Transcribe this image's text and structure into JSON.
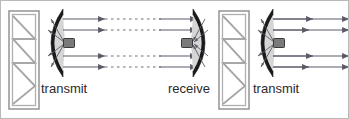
{
  "figure": {
    "width": 349,
    "height": 119,
    "background": "#ffffff",
    "border_color": "#b9b9b9"
  },
  "colors": {
    "tower_outline": "#9a9a9a",
    "tower_inner": "#bdbdbd",
    "dish_rim": "#1a1a1a",
    "dish_fill": "#d5d5d5",
    "beam_line": "#5b5b68",
    "feed_horn_fill": "#7a7a7a",
    "feed_horn_stroke": "#3a3a3a",
    "label_text": "#2b2b2b",
    "dashed_ray": "#6b6b78"
  },
  "labels": [
    {
      "id": "label-transmit-left",
      "text": "transmit",
      "x": 40,
      "y": 92
    },
    {
      "id": "label-receive",
      "text": "receive",
      "x": 167,
      "y": 92
    },
    {
      "id": "label-transmit-right",
      "text": "transmit",
      "x": 252,
      "y": 92
    }
  ],
  "towers": [
    {
      "id": "tower-left",
      "x": 8,
      "y": 10,
      "width": 30,
      "height": 98
    },
    {
      "id": "tower-right",
      "x": 218,
      "y": 10,
      "width": 30,
      "height": 98
    }
  ],
  "dishes": [
    {
      "id": "dish-transmit-left",
      "role": "transmit",
      "facing": "right",
      "apex_x": 42,
      "center_y": 42,
      "rim_x": 62,
      "half_height": 34,
      "feed_x": 64,
      "feed_y": 42
    },
    {
      "id": "dish-receive",
      "role": "receive",
      "facing": "left",
      "apex_x": 212,
      "center_y": 42,
      "rim_x": 192,
      "half_height": 34,
      "feed_x": 188,
      "feed_y": 42
    },
    {
      "id": "dish-transmit-right",
      "role": "transmit",
      "facing": "right",
      "apex_x": 252,
      "center_y": 42,
      "rim_x": 272,
      "half_height": 34,
      "feed_x": 274,
      "feed_y": 42
    }
  ],
  "beams": {
    "ray_y_positions": [
      18,
      29,
      55,
      66
    ],
    "segments": [
      {
        "id": "beam-left-to-receive",
        "from_x": 66,
        "to_x": 196,
        "style": "solid-with-dashed-midsection",
        "dash_from_x": 104,
        "dash_to_x": 158,
        "arrow_x": 146,
        "direction": "right"
      },
      {
        "id": "beam-right-outgoing",
        "from_x": 276,
        "to_x": 344,
        "style": "solid",
        "arrow_x": 312,
        "direction": "right"
      }
    ]
  },
  "feed_rays": {
    "count_per_dish": 4,
    "description": "short converging rays inside each dish between rim and feed horn"
  }
}
